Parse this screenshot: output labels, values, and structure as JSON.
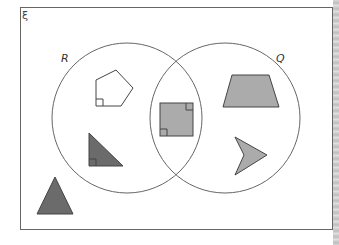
{
  "diagram": {
    "type": "venn",
    "universal_symbol": "ξ",
    "sets": [
      {
        "name": "R",
        "label": "R"
      },
      {
        "name": "Q",
        "label": "Q"
      }
    ],
    "regions": {
      "R_only": [
        "pentagon (one right angle)",
        "right triangle"
      ],
      "R_and_Q": [
        "square"
      ],
      "Q_only": [
        "trapezium",
        "arrowhead"
      ],
      "outside": [
        "triangle"
      ]
    },
    "colors": {
      "frame": "#666666",
      "circle": "#666666",
      "light_fill": "#ababab",
      "dark_fill": "#6b6b6b",
      "outline": "#444444"
    }
  }
}
